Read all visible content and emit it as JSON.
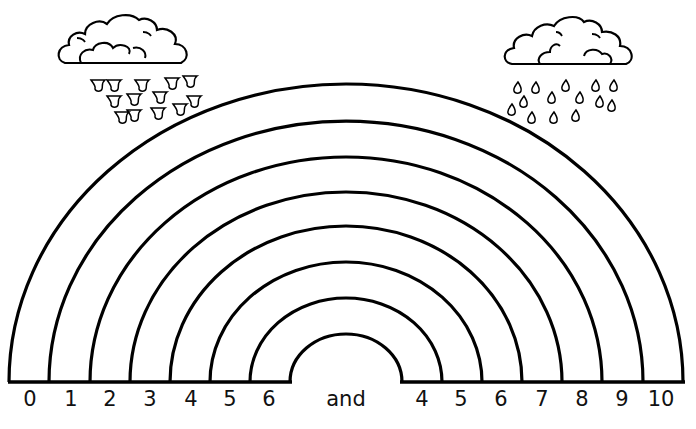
{
  "worksheet": {
    "title": "Rainbow Number Bonds to 10",
    "left_numbers": [
      "0",
      "1",
      "2",
      "3",
      "4",
      "5",
      "6"
    ],
    "connector": "and",
    "right_numbers": [
      "4",
      "5",
      "6",
      "7",
      "8",
      "9",
      "10"
    ],
    "arc_count": 8,
    "clouds": [
      {
        "name": "rain-cloud-left",
        "drops": 13
      },
      {
        "name": "rain-cloud-right",
        "drops": 14
      }
    ],
    "colors": {
      "ink": "#000000",
      "paper": "#ffffff"
    }
  }
}
